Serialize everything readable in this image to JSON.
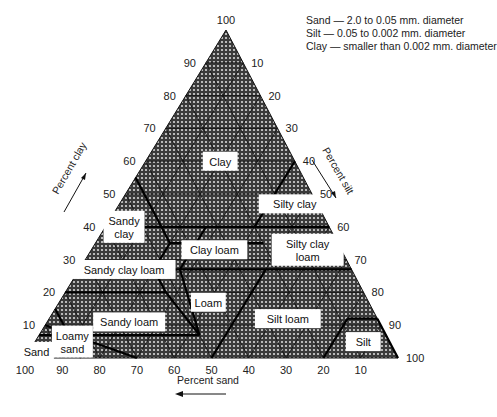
{
  "chart_data": {
    "type": "ternary",
    "legend": [
      "Sand — 2.0 to 0.05 mm. diameter",
      "Silt — 0.05 to 0.002 mm. diameter",
      "Clay — smaller than 0.002 mm. diameter"
    ],
    "axes": {
      "clay": {
        "label": "Percent clay",
        "ticks": [
          10,
          20,
          30,
          40,
          50,
          60,
          70,
          80,
          90,
          100
        ]
      },
      "silt": {
        "label": "Percent silt",
        "ticks": [
          10,
          20,
          30,
          40,
          50,
          60,
          70,
          80,
          90,
          100
        ]
      },
      "sand": {
        "label": "Percent sand",
        "ticks": [
          100,
          90,
          80,
          70,
          60,
          50,
          40,
          30,
          20,
          10
        ]
      }
    },
    "grid": true,
    "classes": [
      {
        "name": "Clay",
        "lines": [
          "Clay"
        ],
        "at": [
          60,
          20
        ]
      },
      {
        "name": "Sandy clay",
        "lines": [
          "Sandy",
          "clay"
        ],
        "at": [
          40,
          5
        ]
      },
      {
        "name": "Silty clay",
        "lines": [
          "Silty clay"
        ],
        "at": [
          47,
          47
        ]
      },
      {
        "name": "Clay loam",
        "lines": [
          "Clay loam"
        ],
        "at": [
          33,
          33
        ]
      },
      {
        "name": "Silty clay loam",
        "lines": [
          "Silty clay",
          "loam"
        ],
        "at": [
          33,
          58
        ]
      },
      {
        "name": "Sandy clay loam",
        "lines": [
          "Sandy clay loam"
        ],
        "at": [
          27,
          12
        ]
      },
      {
        "name": "Loam",
        "lines": [
          "Loam"
        ],
        "at": [
          17,
          40
        ]
      },
      {
        "name": "Silt loam",
        "lines": [
          "Silt loam"
        ],
        "at": [
          12,
          64
        ]
      },
      {
        "name": "Sandy loam",
        "lines": [
          "Sandy loam"
        ],
        "at": [
          11,
          22
        ]
      },
      {
        "name": "Loamy sand",
        "lines": [
          "Loamy",
          "sand"
        ],
        "at": [
          5,
          10
        ]
      },
      {
        "name": "Sand",
        "lines": [
          "Sand"
        ],
        "at": [
          2,
          2
        ]
      },
      {
        "name": "Silt",
        "lines": [
          "Silt"
        ],
        "at": [
          5,
          88
        ]
      }
    ],
    "boundaries": [
      [
        [
          40,
          0
        ],
        [
          40,
          15
        ]
      ],
      [
        [
          40,
          15
        ],
        [
          55,
          0
        ]
      ],
      [
        [
          40,
          15
        ],
        [
          40,
          40
        ]
      ],
      [
        [
          40,
          40
        ],
        [
          60,
          40
        ]
      ],
      [
        [
          40,
          40
        ],
        [
          40,
          60
        ]
      ],
      [
        [
          35,
          20
        ],
        [
          35,
          45
        ]
      ],
      [
        [
          27,
          27
        ],
        [
          27,
          50
        ]
      ],
      [
        [
          27,
          20
        ],
        [
          35,
          20
        ]
      ],
      [
        [
          40,
          15
        ],
        [
          35,
          20
        ]
      ],
      [
        [
          20,
          0
        ],
        [
          20,
          27
        ]
      ],
      [
        [
          20,
          27
        ],
        [
          27,
          20
        ]
      ],
      [
        [
          27,
          20
        ],
        [
          27,
          27
        ]
      ],
      [
        [
          27,
          27
        ],
        [
          40,
          27
        ]
      ],
      [
        [
          7,
          0
        ],
        [
          7,
          43
        ]
      ],
      [
        [
          7,
          43
        ],
        [
          27,
          27
        ]
      ],
      [
        [
          15,
          0
        ],
        [
          0,
          15
        ]
      ],
      [
        [
          10,
          0
        ],
        [
          0,
          30
        ]
      ],
      [
        [
          20,
          27
        ],
        [
          7,
          43
        ]
      ],
      [
        [
          27,
          50
        ],
        [
          0,
          50
        ]
      ],
      [
        [
          27,
          50
        ],
        [
          27,
          73
        ]
      ],
      [
        [
          40,
          60
        ],
        [
          40,
          60
        ]
      ],
      [
        [
          12,
          80
        ],
        [
          0,
          80
        ]
      ],
      [
        [
          12,
          80
        ],
        [
          12,
          88
        ]
      ],
      [
        [
          12,
          88
        ],
        [
          0,
          100
        ]
      ]
    ]
  }
}
